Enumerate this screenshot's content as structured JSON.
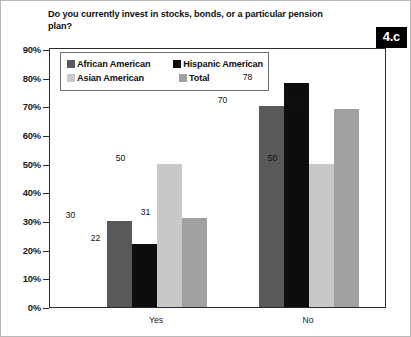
{
  "figure": {
    "title": "Do you currently invest in stocks, bonds, or a particular pension plan?",
    "badge": "4.c",
    "badge_color": "#000000",
    "badge_text_color": "#ffffff",
    "frame_color": "#2a2a2a"
  },
  "legend": {
    "entries": [
      {
        "label": "African American",
        "color": "#595959"
      },
      {
        "label": "Hispanic American",
        "color": "#0d0d0d"
      },
      {
        "label": "Asian American",
        "color": "#c8c8c8"
      },
      {
        "label": "Total",
        "color": "#a0a0a0"
      }
    ]
  },
  "axis": {
    "y_ticks": [
      "90%",
      "80%",
      "70%",
      "60%",
      "50%",
      "40%",
      "30%",
      "20%",
      "10%",
      "0%"
    ],
    "x_categories": [
      "Yes",
      "No"
    ]
  },
  "chart_data": {
    "type": "bar",
    "title": "Do you currently invest in stocks, bonds, or a particular pension plan?",
    "xlabel": "",
    "ylabel": "",
    "ylim": [
      0,
      90
    ],
    "ytick_step": 10,
    "grid": false,
    "legend_position": "top-left-inside",
    "value_labels": true,
    "categories": [
      "Yes",
      "No"
    ],
    "series": [
      {
        "name": "African American",
        "color": "#595959",
        "values": [
          30,
          70
        ]
      },
      {
        "name": "Hispanic American",
        "color": "#0d0d0d",
        "values": [
          22,
          78
        ]
      },
      {
        "name": "Asian American",
        "color": "#c8c8c8",
        "values": [
          50,
          50
        ]
      },
      {
        "name": "Total",
        "color": "#a0a0a0",
        "values": [
          31,
          69
        ]
      }
    ]
  }
}
